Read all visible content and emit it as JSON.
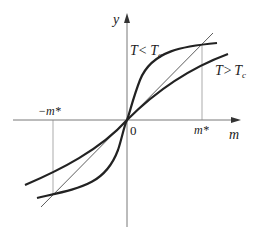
{
  "diagram": {
    "axes": {
      "x_label": "m",
      "y_label": "y",
      "origin_label": "0",
      "pos_tick_label": "m*",
      "neg_tick_label": "−m*"
    },
    "curves": [
      {
        "name": "T < Tc",
        "label_main": "T<",
        "label_sub_T": "T",
        "label_sub": "c"
      },
      {
        "name": "T > Tc",
        "label_main": "T>",
        "label_sub_T": "T",
        "label_sub": "c"
      }
    ],
    "line": {
      "name": "y = m (straight line through origin)"
    },
    "colors": {
      "curve": "#222222",
      "axis": "#555555",
      "guide": "#888888"
    }
  }
}
